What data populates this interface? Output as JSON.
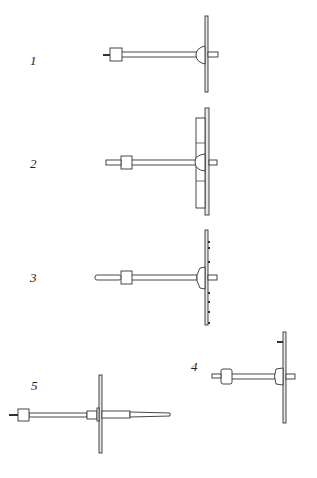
{
  "figure": {
    "variants": [
      {
        "id": "1",
        "label": "1",
        "features": [
          "single thin plate",
          "hemispherical hub",
          "short left collar",
          "short right stub"
        ]
      },
      {
        "id": "2",
        "label": "2",
        "features": [
          "thin plate with rectangular backing",
          "hemispherical hub",
          "left collar",
          "left tip",
          "right stub"
        ]
      },
      {
        "id": "3",
        "label": "3",
        "features": [
          "thin plate with small pins",
          "conical hub",
          "left collar",
          "left tip",
          "right stub"
        ]
      },
      {
        "id": "4",
        "label": "4",
        "features": [
          "thin plate with small tab",
          "rounded hub",
          "large left collar",
          "left stub",
          "right stub"
        ]
      },
      {
        "id": "5",
        "label": "5",
        "features": [
          "thin plate",
          "sleeve through plate",
          "long right tapered shaft",
          "left collar",
          "left stub"
        ]
      }
    ]
  }
}
